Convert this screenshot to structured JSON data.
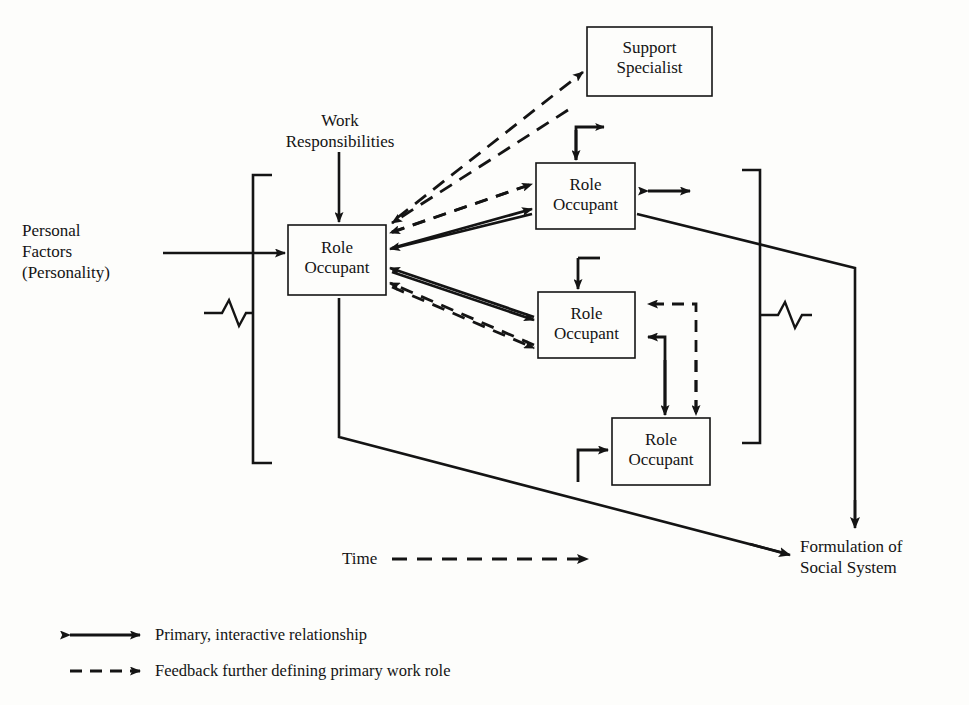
{
  "diagram": {
    "boxes": [
      {
        "id": "support-specialist",
        "label": "Support\nSpecialist",
        "line1": "Support",
        "line2": "Specialist",
        "x": 587,
        "y": 27,
        "w": 125,
        "h": 69
      },
      {
        "id": "role-occupant-main",
        "label": "Role\nOccupant",
        "line1": "Role",
        "line2": "Occupant",
        "x": 288,
        "y": 225,
        "w": 98,
        "h": 70
      },
      {
        "id": "role-occupant-1",
        "label": "Role\nOccupant",
        "line1": "Role",
        "line2": "Occupant",
        "x": 536,
        "y": 163,
        "w": 99,
        "h": 66
      },
      {
        "id": "role-occupant-2",
        "label": "Role\nOccupant",
        "line1": "Role",
        "line2": "Occupant",
        "x": 538,
        "y": 292,
        "w": 97,
        "h": 66
      },
      {
        "id": "role-occupant-3",
        "label": "Role\nOccupant",
        "line1": "Role",
        "line2": "Occupant",
        "x": 612,
        "y": 418,
        "w": 98,
        "h": 67
      }
    ],
    "labels": [
      {
        "id": "work-responsibilities",
        "line1": "Work",
        "line2": "Responsibilities",
        "x": 310,
        "y": 112
      },
      {
        "id": "personal-factors",
        "line1": "Personal",
        "line2": "Factors",
        "line3": "(Personality)",
        "x": 22,
        "y": 222
      },
      {
        "id": "formulation",
        "line1": "Formulation of",
        "line2": "Social System",
        "x": 800,
        "y": 538
      },
      {
        "id": "time",
        "text": "Time",
        "x": 342,
        "y": 550
      }
    ],
    "legend": [
      {
        "id": "legend-primary",
        "text": "Primary, interactive relationship",
        "style": "solid-double-arrow"
      },
      {
        "id": "legend-feedback",
        "text": "Feedback further defining primary work role",
        "style": "dashed-arrow"
      }
    ],
    "colors": {
      "ink": "#141414",
      "paper": "#fdfdfb"
    }
  }
}
